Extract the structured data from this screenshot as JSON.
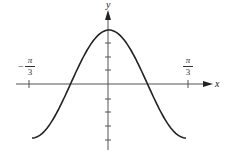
{
  "chart_data": {
    "type": "line",
    "title": "",
    "function": "y = 4cos(3x)",
    "xlabel": "x",
    "ylabel": "y",
    "x_tick_labels": [
      {
        "value": "-π/3",
        "numerator": "π",
        "denominator": "3",
        "sign": "−"
      },
      {
        "value": "π/3",
        "numerator": "π",
        "denominator": "3",
        "sign": ""
      }
    ],
    "xlim": [
      -1.0472,
      1.0472
    ],
    "ylim": [
      -4,
      4
    ],
    "y_ticks": [
      -4,
      -3,
      -2,
      -1,
      1,
      2,
      3,
      4
    ],
    "x": [
      -1.0472,
      -0.7854,
      -0.5236,
      -0.2618,
      0,
      0.2618,
      0.5236,
      0.7854,
      1.0472
    ],
    "values": [
      -4,
      -2.83,
      0,
      2.83,
      4,
      2.83,
      0,
      -2.83,
      -4
    ],
    "grid": false,
    "legend": null
  },
  "labels": {
    "x_axis": "x",
    "y_axis": "y",
    "left_tick_sign": "−",
    "left_tick_num": "π",
    "left_tick_den": "3",
    "right_tick_num": "π",
    "right_tick_den": "3"
  }
}
